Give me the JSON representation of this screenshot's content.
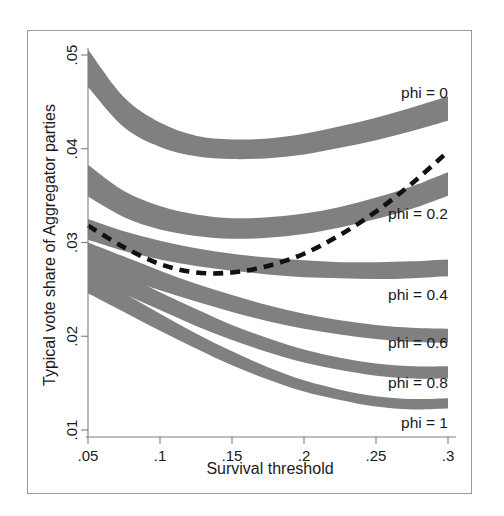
{
  "figure": {
    "background_color": "#ffffff",
    "frame_color": "#9a9a9a",
    "band_color": "#808080",
    "reference_curve_color": "#111111"
  },
  "axes": {
    "x_title": "Survival threshold",
    "y_title": "Typical vote share of Aggregator parties",
    "x_ticks": [
      ".05",
      ".1",
      ".15",
      ".2",
      ".25",
      ".3"
    ],
    "y_ticks": [
      ".01",
      ".02",
      ".03",
      ".04",
      ".05"
    ]
  },
  "labels": {
    "phi0": "phi = 0",
    "phi02": "phi = 0.2",
    "phi04": "phi = 0.4",
    "phi06": "phi = 0.6",
    "phi08": "phi = 0.8",
    "phi1": "phi = 1"
  },
  "chart_data": {
    "type": "area",
    "title": "",
    "subtitle": "",
    "xlabel": "Survival threshold",
    "ylabel": "Typical vote share of Aggregator parties",
    "xlim": [
      0.05,
      0.3
    ],
    "ylim": [
      0.01,
      0.05
    ],
    "xticks": [
      0.05,
      0.1,
      0.15,
      0.2,
      0.25,
      0.3
    ],
    "xticklabels": [
      ".05",
      ".1",
      ".15",
      ".2",
      ".25",
      ".3"
    ],
    "yticks": [
      0.01,
      0.02,
      0.03,
      0.04,
      0.05
    ],
    "yticklabels": [
      ".01",
      ".02",
      ".03",
      ".04",
      ".05"
    ],
    "grid": false,
    "legend": "inline-right-annotations",
    "x": [
      0.05,
      0.075,
      0.1,
      0.125,
      0.15,
      0.175,
      0.2,
      0.225,
      0.25,
      0.275,
      0.3
    ],
    "series": [
      {
        "name": "phi = 0",
        "style": "shaded-confidence-band",
        "upper": [
          0.0506,
          0.0455,
          0.0428,
          0.0414,
          0.041,
          0.0411,
          0.0416,
          0.0424,
          0.0433,
          0.0444,
          0.0456
        ],
        "lower": [
          0.0466,
          0.0423,
          0.0402,
          0.0392,
          0.0389,
          0.039,
          0.0394,
          0.0401,
          0.0409,
          0.0419,
          0.043
        ],
        "label_value": 0.0
      },
      {
        "name": "phi = 0.2",
        "style": "shaded-confidence-band",
        "upper": [
          0.0383,
          0.0355,
          0.0339,
          0.033,
          0.0326,
          0.0327,
          0.0331,
          0.0338,
          0.0348,
          0.036,
          0.0375
        ],
        "lower": [
          0.0349,
          0.0327,
          0.0314,
          0.0307,
          0.0304,
          0.0305,
          0.0309,
          0.0316,
          0.0325,
          0.0336,
          0.035
        ],
        "label_value": 0.2
      },
      {
        "name": "phi = 0.4",
        "style": "shaded-confidence-band",
        "upper": [
          0.0325,
          0.0312,
          0.0302,
          0.0294,
          0.0288,
          0.0284,
          0.0281,
          0.0279,
          0.0279,
          0.028,
          0.0282
        ],
        "lower": [
          0.0303,
          0.0291,
          0.0282,
          0.0275,
          0.027,
          0.0266,
          0.0263,
          0.0262,
          0.0261,
          0.0262,
          0.0264
        ],
        "label_value": 0.4
      },
      {
        "name": "phi = 0.6",
        "style": "shaded-confidence-band",
        "upper": [
          0.03,
          0.0285,
          0.027,
          0.0256,
          0.0244,
          0.0233,
          0.0224,
          0.0217,
          0.0212,
          0.0209,
          0.0208
        ],
        "lower": [
          0.0275,
          0.0262,
          0.0249,
          0.0237,
          0.0226,
          0.0216,
          0.0208,
          0.0202,
          0.0197,
          0.0194,
          0.0193
        ],
        "label_value": 0.6
      },
      {
        "name": "phi = 0.8",
        "style": "shaded-confidence-band",
        "upper": [
          0.0285,
          0.0266,
          0.0247,
          0.0229,
          0.0212,
          0.0198,
          0.0186,
          0.0177,
          0.0171,
          0.0168,
          0.0168
        ],
        "lower": [
          0.0262,
          0.0245,
          0.0228,
          0.0211,
          0.0196,
          0.0183,
          0.0172,
          0.0164,
          0.0158,
          0.0155,
          0.0155
        ],
        "label_value": 0.8
      },
      {
        "name": "phi = 1",
        "style": "shaded-confidence-band",
        "upper": [
          0.0267,
          0.0246,
          0.0224,
          0.0203,
          0.0184,
          0.0167,
          0.0153,
          0.0143,
          0.0136,
          0.0133,
          0.0134
        ],
        "lower": [
          0.0246,
          0.0226,
          0.0206,
          0.0187,
          0.0169,
          0.0154,
          0.0141,
          0.0132,
          0.0125,
          0.0122,
          0.0123
        ],
        "label_value": 1.0
      }
    ],
    "reference_curve": {
      "name": "reference (dashed)",
      "style": "dashed-line",
      "y": [
        0.0318,
        0.0295,
        0.0277,
        0.0268,
        0.0268,
        0.0275,
        0.0288,
        0.0308,
        0.0333,
        0.0363,
        0.0397
      ]
    }
  }
}
